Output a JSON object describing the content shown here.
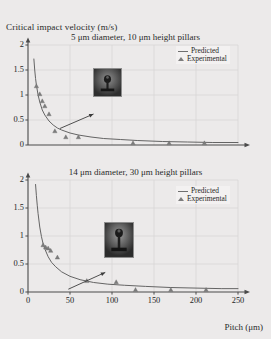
{
  "axis": {
    "ylabel_top": "Critical impact velocity (m/s)",
    "xlabel": "Pitch (μm)",
    "yticks": [
      "0",
      "0.5",
      "1",
      "1.5",
      "2"
    ],
    "xticks": [
      "0",
      "50",
      "100",
      "150",
      "200",
      "250"
    ]
  },
  "legend": {
    "predicted": "Predicted",
    "experimental": "Experimental"
  },
  "colors": {
    "background": "#eceaea",
    "curve": "#5d5d5d",
    "marker": "#7c7c7c",
    "grid": "#d7d4d4",
    "axis": "#4a4a4a",
    "inset_frame": "#8d8d8d"
  },
  "chart_data": [
    {
      "type": "line",
      "id": "top-panel",
      "title": "5 μm diameter, 10 μm height pillars",
      "xlabel": "Pitch (μm)",
      "ylabel": "Critical impact velocity (m/s)",
      "xlim": [
        0,
        250
      ],
      "ylim": [
        0,
        2
      ],
      "xticks": [
        0,
        50,
        100,
        150,
        200,
        250
      ],
      "yticks": [
        0,
        0.5,
        1,
        1.5,
        2
      ],
      "grid": true,
      "legend_position": "upper-right",
      "series": [
        {
          "name": "Predicted",
          "style": "line",
          "x": [
            7,
            8,
            9,
            10,
            12,
            14,
            17,
            20,
            25,
            30,
            35,
            40,
            50,
            60,
            75,
            90,
            110,
            130,
            160,
            190,
            220,
            250
          ],
          "y": [
            1.72,
            1.5,
            1.33,
            1.2,
            1.0,
            0.86,
            0.7,
            0.6,
            0.48,
            0.4,
            0.34,
            0.3,
            0.24,
            0.2,
            0.16,
            0.13,
            0.11,
            0.09,
            0.07,
            0.06,
            0.05,
            0.05
          ]
        },
        {
          "name": "Experimental",
          "style": "triangle",
          "x": [
            10,
            14,
            17,
            20,
            25,
            32,
            45,
            60,
            125,
            168,
            210
          ],
          "y": [
            1.18,
            1.02,
            0.88,
            0.78,
            0.62,
            0.28,
            0.16,
            0.16,
            0.04,
            0.04,
            0.04
          ]
        }
      ],
      "annotation": {
        "type": "arrow-to-inset",
        "from": [
          38,
          0.33
        ],
        "to": [
          78,
          0.62
        ]
      },
      "inset": {
        "type": "micrograph",
        "description": "droplet impaling pillar array"
      }
    },
    {
      "type": "line",
      "id": "bottom-panel",
      "title": "14 μm diameter, 30 μm height pillars",
      "xlabel": "Pitch (μm)",
      "ylabel": "Critical impact velocity (m/s)",
      "xlim": [
        0,
        250
      ],
      "ylim": [
        0,
        2
      ],
      "xticks": [
        0,
        50,
        100,
        150,
        200,
        250
      ],
      "yticks": [
        0,
        0.5,
        1,
        1.5,
        2
      ],
      "grid": true,
      "legend_position": "upper-right",
      "series": [
        {
          "name": "Predicted",
          "style": "line",
          "x": [
            9,
            10,
            11,
            12,
            14,
            16,
            18,
            20,
            24,
            28,
            33,
            40,
            50,
            62,
            78,
            95,
            115,
            140,
            170,
            200,
            230,
            250
          ],
          "y": [
            1.92,
            1.72,
            1.55,
            1.4,
            1.16,
            0.99,
            0.86,
            0.77,
            0.63,
            0.53,
            0.45,
            0.36,
            0.28,
            0.22,
            0.17,
            0.14,
            0.12,
            0.1,
            0.08,
            0.07,
            0.06,
            0.06
          ]
        },
        {
          "name": "Experimental",
          "style": "triangle",
          "x": [
            18,
            21,
            24,
            27,
            35,
            70,
            105,
            128,
            170,
            212
          ],
          "y": [
            0.84,
            0.8,
            0.78,
            0.74,
            0.62,
            0.2,
            0.18,
            0.04,
            0.04,
            0.04
          ]
        }
      ],
      "annotation": {
        "type": "arrow-to-inset",
        "from": [
          48,
          0.05
        ],
        "to": [
          92,
          0.35
        ]
      },
      "inset": {
        "type": "micrograph",
        "description": "droplet on tall pillar array"
      }
    }
  ]
}
